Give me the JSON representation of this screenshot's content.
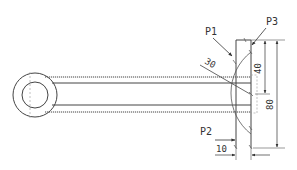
{
  "diagram": {
    "type": "technical-drawing",
    "labels": {
      "p1": "P1",
      "p2": "P2",
      "p3": "P3"
    },
    "dimensions": {
      "angle": "30",
      "height_top": "40",
      "height_total": "80",
      "width_plate": "10"
    },
    "colors": {
      "line": "#333333",
      "background": "#ffffff"
    }
  }
}
